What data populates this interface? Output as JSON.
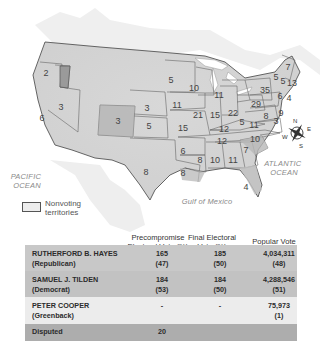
{
  "map": {
    "legend": {
      "swatch_label": "Nonvoting territories"
    },
    "water_labels": {
      "pacific": "PACIFIC OCEAN",
      "atlantic": "ATLANTIC OCEAN",
      "gulf": "Gulf of Mexico"
    },
    "compass": {
      "n": "N",
      "s": "S",
      "e": "E",
      "w": "W"
    },
    "state_votes": {
      "or": "2",
      "ca": "6",
      "nv": "3",
      "co": "3",
      "ne": "3",
      "ks": "5",
      "tx": "8",
      "mn": "5",
      "ia": "11",
      "mo": "15",
      "ar": "6",
      "la": "8",
      "wi": "10",
      "il": "21",
      "mi": "11",
      "in": "15",
      "oh": "22",
      "ky": "12",
      "tn": "12",
      "ms": "8",
      "al": "10",
      "ga": "11",
      "fl": "4",
      "sc": "7",
      "nc": "10",
      "va": "11",
      "wv": "5",
      "pa": "29",
      "ny": "35",
      "me": "7",
      "vt": "5",
      "nh": "5",
      "ma": "13",
      "ct": "6",
      "ri": "4",
      "nj": "9",
      "de": "3",
      "md": "8"
    },
    "colors": {
      "land": "#d9d9d9",
      "hayes_state": "#dcdcdc",
      "tilden_state": "#bdbdbd",
      "territory": "#e8e8e8",
      "border": "#555555",
      "water": "#ffffff"
    }
  },
  "table": {
    "headers": {
      "precompromise": "Precompromise Electoral Vote (%)",
      "final": "Final Electoral Vote (%)",
      "popular": "Popular Vote (%)"
    },
    "rows": [
      {
        "name": "RUTHERFORD B. HAYES",
        "party": "(Republican)",
        "pre": "165",
        "pre_pct": "(47)",
        "final": "185",
        "final_pct": "(50)",
        "pop": "4,034,311",
        "pop_pct": "(48)"
      },
      {
        "name": "SAMUEL J. TILDEN",
        "party": "(Democrat)",
        "pre": "184",
        "pre_pct": "(53)",
        "final": "184",
        "final_pct": "(50)",
        "pop": "4,288,546",
        "pop_pct": "(51)"
      },
      {
        "name": "PETER COOPER",
        "party": "(Greenback)",
        "pre": "-",
        "pre_pct": "",
        "final": "-",
        "final_pct": "",
        "pop": "75,973",
        "pop_pct": "(1)"
      },
      {
        "name": "Disputed",
        "party": "",
        "pre": "20",
        "pre_pct": "",
        "final": "",
        "final_pct": "",
        "pop": "",
        "pop_pct": ""
      }
    ],
    "colors": {
      "hayes_row": "#c8c8c8",
      "tilden_row": "#c2c2c2",
      "cooper_row": "#ececec",
      "disputed_row": "#adadad"
    }
  }
}
